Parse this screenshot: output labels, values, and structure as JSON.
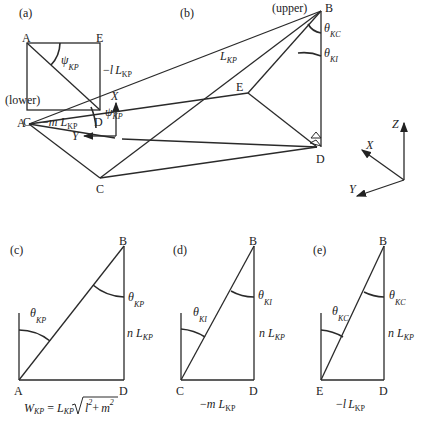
{
  "panels": {
    "a": {
      "tag": "(a)",
      "points": {
        "A": "A",
        "E": "E",
        "C": "C",
        "D": "D"
      },
      "angle": {
        "sym": "ψ",
        "sub": "KP"
      },
      "right_side": {
        "pre": "−",
        "var": "l",
        "L": "L",
        "sub": "KP"
      },
      "bottom_side": {
        "pre": "−",
        "var": "m",
        "L": "L",
        "sub": "KP"
      },
      "axes": {
        "x": "X",
        "y": "Y"
      }
    },
    "b": {
      "tag": "(b)",
      "points": {
        "A": "A",
        "B": "B",
        "C": "C",
        "D": "D",
        "E": "E"
      },
      "upper": "(upper)",
      "lower": "(lower)",
      "edge": {
        "L": "L",
        "sub": "KP"
      },
      "angle_psi": {
        "sym": "ψ",
        "sub": "KP"
      },
      "angle_kc": {
        "sym": "θ",
        "sub": "KC"
      },
      "angle_ki": {
        "sym": "θ",
        "sub": "KI"
      },
      "axes": {
        "x": "X",
        "y": "Y",
        "z": "Z"
      }
    },
    "c": {
      "tag": "(c)",
      "points": {
        "A": "A",
        "B": "B",
        "D": "D"
      },
      "angle_left": {
        "sym": "θ",
        "sub": "KP"
      },
      "angle_right": {
        "sym": "θ",
        "sub": "KP"
      },
      "height": {
        "var": "n",
        "L": "L",
        "sub": "KP"
      },
      "formula": {
        "W": "W",
        "Wsub": "KP",
        "eq": "=",
        "L": "L",
        "Lsub": "KP",
        "a": "l",
        "b": "m",
        "exp": "2",
        "plus": "+"
      }
    },
    "d": {
      "tag": "(d)",
      "points": {
        "C": "C",
        "B": "B",
        "D": "D"
      },
      "angle_left": {
        "sym": "θ",
        "sub": "KI"
      },
      "angle_right": {
        "sym": "θ",
        "sub": "KI"
      },
      "height": {
        "var": "n",
        "L": "L",
        "sub": "KP"
      },
      "base": {
        "pre": "−",
        "var": "m",
        "L": "L",
        "sub": "KP"
      }
    },
    "e": {
      "tag": "(e)",
      "points": {
        "E": "E",
        "B": "B",
        "D": "D"
      },
      "angle_left": {
        "sym": "θ",
        "sub": "KC"
      },
      "angle_right": {
        "sym": "θ",
        "sub": "KC"
      },
      "height": {
        "var": "n",
        "L": "L",
        "sub": "KP"
      },
      "base": {
        "pre": "−",
        "var": "l",
        "L": "L",
        "sub": "KP"
      }
    }
  }
}
